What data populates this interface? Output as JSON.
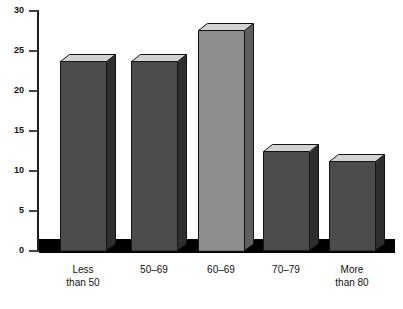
{
  "chart_data": {
    "type": "bar",
    "title": "",
    "subtitle": "",
    "xlabel": "",
    "ylabel": "",
    "categories": [
      "Less\nthan 50",
      "50–69",
      "60–69",
      "70–79",
      "More\nthan 80"
    ],
    "values": [
      23.7,
      23.7,
      27.6,
      12.4,
      11.2
    ],
    "ylim": [
      0,
      30
    ],
    "yticks": [
      0,
      5,
      10,
      15,
      20,
      25,
      30
    ],
    "ytick_labels": [
      "0",
      "5",
      "10",
      "15",
      "20",
      "25",
      "30"
    ],
    "grid": false,
    "legend": null,
    "style": "3d-extruded-bars",
    "bar_colors": [
      "#4c4c4c",
      "#4c4c4c",
      "#8d8d8d",
      "#4c4c4c",
      "#4c4c4c"
    ],
    "bar_side_colors": [
      "#2e2e2e",
      "#2e2e2e",
      "#5f5f5f",
      "#2e2e2e",
      "#2e2e2e"
    ],
    "bar_top_color": "#d2d2d2",
    "baseline_color": "#000000",
    "axis_color": "#1d1d1d",
    "background": "#ffffff"
  }
}
